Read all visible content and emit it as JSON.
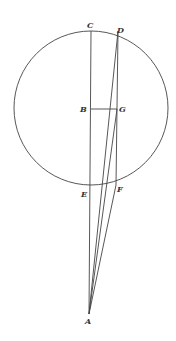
{
  "diagram": {
    "stroke_color": "#444444",
    "circle": {
      "cx": 91,
      "cy": 108,
      "r": 77
    },
    "points": {
      "A": {
        "x": 89,
        "y": 314
      },
      "B": {
        "x": 91,
        "y": 109
      },
      "C": {
        "x": 91,
        "y": 31
      },
      "D": {
        "x": 118,
        "y": 31
      },
      "E": {
        "x": 91,
        "y": 186
      },
      "F": {
        "x": 116,
        "y": 185
      },
      "G": {
        "x": 117,
        "y": 109
      }
    },
    "labels": {
      "A": "A",
      "B": "B",
      "C": "C",
      "D": "D",
      "E": "E",
      "F": "F",
      "G": "G"
    },
    "segments": [
      [
        "A",
        "C"
      ],
      [
        "A",
        "D"
      ],
      [
        "A",
        "G"
      ],
      [
        "A",
        "F"
      ],
      [
        "D",
        "F"
      ],
      [
        "B",
        "G"
      ]
    ]
  }
}
